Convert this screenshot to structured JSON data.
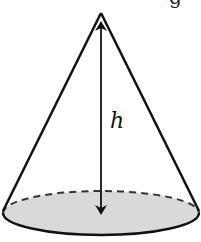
{
  "figure": {
    "type": "cone",
    "height_label": "h",
    "top_text_fragment": "g",
    "colors": {
      "stroke": "#111111",
      "base_fill": "#d9d9d9",
      "background": "#ffffff"
    }
  }
}
